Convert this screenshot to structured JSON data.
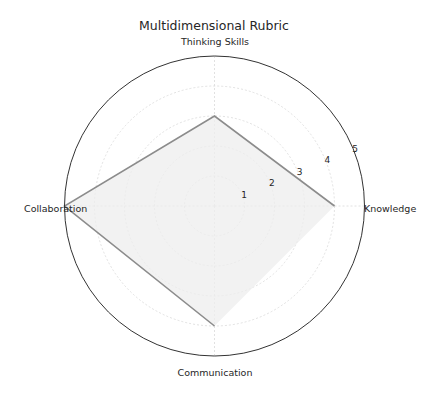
{
  "chart_data": {
    "type": "radar",
    "title": "Multidimensional Rubric",
    "categories": [
      "Knowledge",
      "Thinking Skills",
      "Collaboration",
      "Communication"
    ],
    "series": [
      {
        "name": "Rubric",
        "values": [
          4,
          3,
          5,
          4
        ]
      }
    ],
    "radial_ticks": [
      "1",
      "2",
      "3",
      "4",
      "5"
    ],
    "rlim": [
      0,
      5
    ],
    "grid": true,
    "legend": null,
    "colors": {
      "line": "#8c8c8c",
      "fill": "#eeeeee",
      "grid": "#d9d9d9",
      "frame": "#333333"
    }
  }
}
